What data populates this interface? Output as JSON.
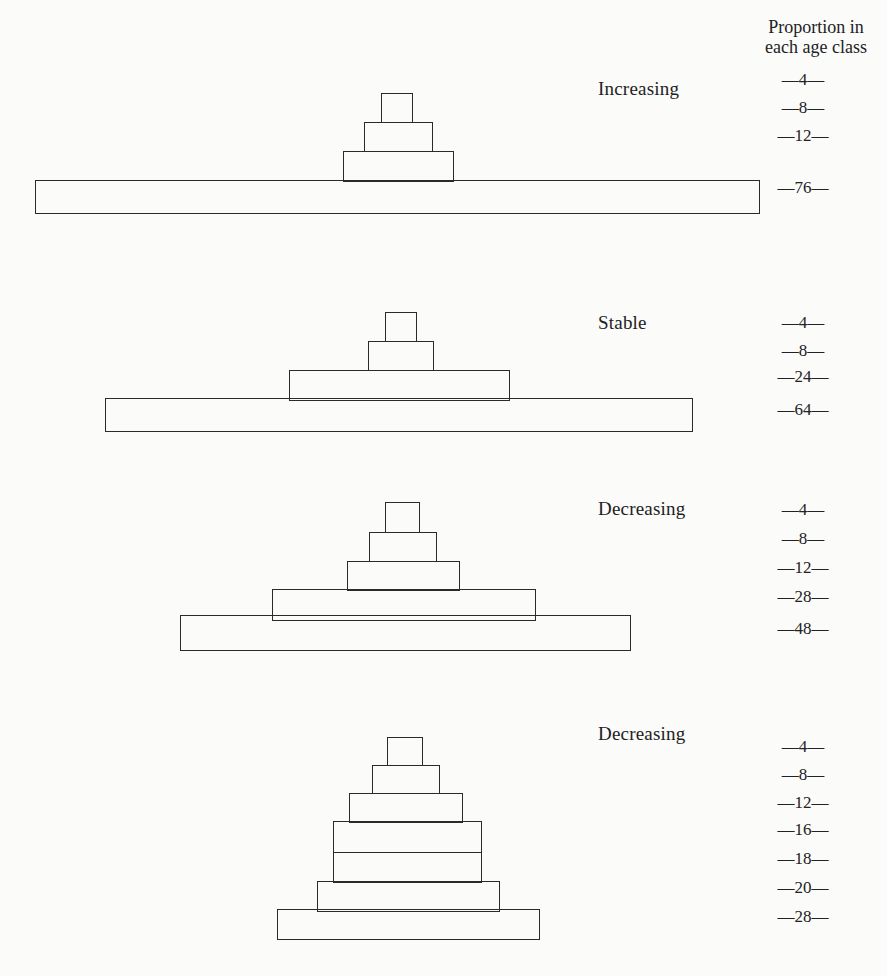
{
  "header": {
    "line1": "Proportion in",
    "line2": "each age class"
  },
  "pyramids": [
    {
      "label": "Increasing",
      "label_pos": [
        598,
        78
      ],
      "bars": [
        {
          "value": "—4—",
          "x": 381,
          "y": 93,
          "w": 32,
          "h": 30
        },
        {
          "value": "—8—",
          "x": 364,
          "y": 122,
          "w": 69,
          "h": 30
        },
        {
          "value": "—12—",
          "x": 343,
          "y": 151,
          "w": 111,
          "h": 31
        },
        {
          "value": "—76—",
          "x": 35,
          "y": 180,
          "w": 725,
          "h": 34
        }
      ],
      "value_y": [
        70,
        98,
        126,
        178
      ]
    },
    {
      "label": "Stable",
      "label_pos": [
        598,
        312
      ],
      "bars": [
        {
          "value": "—4—",
          "x": 385,
          "y": 312,
          "w": 32,
          "h": 30
        },
        {
          "value": "—8—",
          "x": 368,
          "y": 341,
          "w": 66,
          "h": 30
        },
        {
          "value": "—24—",
          "x": 289,
          "y": 370,
          "w": 221,
          "h": 31
        },
        {
          "value": "—64—",
          "x": 105,
          "y": 398,
          "w": 588,
          "h": 34
        }
      ],
      "value_y": [
        313,
        341,
        367,
        400
      ]
    },
    {
      "label": "Decreasing",
      "label_pos": [
        598,
        498
      ],
      "bars": [
        {
          "value": "—4—",
          "x": 385,
          "y": 502,
          "w": 35,
          "h": 31
        },
        {
          "value": "—8—",
          "x": 369,
          "y": 532,
          "w": 68,
          "h": 30
        },
        {
          "value": "—12—",
          "x": 347,
          "y": 561,
          "w": 113,
          "h": 30
        },
        {
          "value": "—28—",
          "x": 272,
          "y": 589,
          "w": 264,
          "h": 32
        },
        {
          "value": "—48—",
          "x": 180,
          "y": 615,
          "w": 451,
          "h": 36
        }
      ],
      "value_y": [
        500,
        529,
        558,
        587,
        619
      ]
    },
    {
      "label": "Decreasing",
      "label_pos": [
        598,
        723
      ],
      "bars": [
        {
          "value": "—4—",
          "x": 387,
          "y": 737,
          "w": 36,
          "h": 29
        },
        {
          "value": "—8—",
          "x": 372,
          "y": 765,
          "w": 68,
          "h": 29
        },
        {
          "value": "—12—",
          "x": 349,
          "y": 793,
          "w": 114,
          "h": 30
        },
        {
          "value": "—16—",
          "x": 333,
          "y": 821,
          "w": 149,
          "h": 32
        },
        {
          "value": "—18—",
          "x": 333,
          "y": 852,
          "w": 149,
          "h": 31
        },
        {
          "value": "—20—",
          "x": 317,
          "y": 881,
          "w": 183,
          "h": 31
        },
        {
          "value": "—28—",
          "x": 277,
          "y": 909,
          "w": 263,
          "h": 31
        }
      ],
      "value_y": [
        737,
        765,
        793,
        820,
        849,
        878,
        907
      ]
    }
  ],
  "chart_data": {
    "type": "bar",
    "ylabel": "Proportion in each age class",
    "note": "Values listed from youngest-top? No: listed top (oldest) to bottom (youngest base).",
    "series": [
      {
        "name": "Increasing",
        "values_top_to_bottom": [
          4,
          8,
          12,
          76
        ]
      },
      {
        "name": "Stable",
        "values_top_to_bottom": [
          4,
          8,
          24,
          64
        ]
      },
      {
        "name": "Decreasing",
        "values_top_to_bottom": [
          4,
          8,
          12,
          28,
          48
        ]
      },
      {
        "name": "Decreasing",
        "values_top_to_bottom": [
          4,
          8,
          12,
          16,
          18,
          20,
          28
        ]
      }
    ]
  }
}
